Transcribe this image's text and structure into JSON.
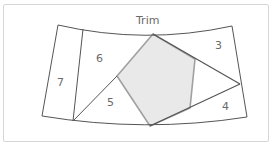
{
  "diagram": {
    "title": "Trim",
    "regions": [
      {
        "id": "3",
        "label": "3"
      },
      {
        "id": "4",
        "label": "4"
      },
      {
        "id": "5",
        "label": "5"
      },
      {
        "id": "6",
        "label": "6"
      },
      {
        "id": "7",
        "label": "7"
      }
    ],
    "colors": {
      "line": "#555555",
      "pentagon_fill": "#e9e9e9",
      "pentagon_edge": "#9a9a9a",
      "frame": "#d6d6d6",
      "label": "#6a6a6a"
    }
  }
}
